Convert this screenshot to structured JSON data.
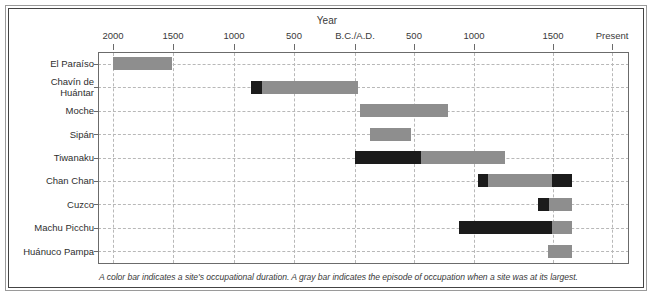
{
  "figure": {
    "title": "Year",
    "footnote": "A color bar indicates a site's occupational duration. A gray bar indicates the episode of occupation when a site was at its largest."
  },
  "chart_data": {
    "type": "bar",
    "orientation": "horizontal",
    "title": "Year",
    "xlabel": "Year",
    "ylabel": "",
    "grid": true,
    "legend_position": "none",
    "axis_ticks": [
      {
        "label": "2000",
        "value": -2000,
        "x": 113
      },
      {
        "label": "1500",
        "value": -1500,
        "x": 173
      },
      {
        "label": "1000",
        "value": -1000,
        "x": 234
      },
      {
        "label": "500",
        "value": -500,
        "x": 294
      },
      {
        "label": "B.C./A.D.",
        "value": 0,
        "x": 355
      },
      {
        "label": "500",
        "value": 500,
        "x": 414
      },
      {
        "label": "1000",
        "value": 1000,
        "x": 474
      },
      {
        "label": "1500",
        "value": 1500,
        "x": 553
      },
      {
        "label": "Present",
        "value": 2000,
        "x": 612
      }
    ],
    "categories": [
      "El Paraíso",
      "Chavín de Huántar",
      "Moche",
      "Sipán",
      "Tiwanaku",
      "Chan Chan",
      "Cuzco",
      "Machu Picchu",
      "Huánuco Pampa"
    ],
    "colors": {
      "occupation": "#8e8e8e",
      "largest": "#1b1b1b",
      "grid": "#b8b8b8",
      "axis": "#6b6b6b",
      "text": "#2e2e2e"
    },
    "series": [
      {
        "name": "El Paraíso",
        "row": 0,
        "segments": [
          {
            "type": "occupation",
            "color": "#8e8e8e",
            "x0": 113,
            "x1": 172,
            "start_year": -2000,
            "end_year": -1510
          }
        ]
      },
      {
        "name": "Chavín de Huántar",
        "row": 1,
        "segments": [
          {
            "type": "largest",
            "color": "#1b1b1b",
            "x0": 251,
            "x1": 262,
            "start_year": -860,
            "end_year": -770
          },
          {
            "type": "occupation",
            "color": "#8e8e8e",
            "x0": 262,
            "x1": 358,
            "start_year": -770,
            "end_year": 25
          }
        ]
      },
      {
        "name": "Moche",
        "row": 2,
        "segments": [
          {
            "type": "occupation",
            "color": "#8e8e8e",
            "x0": 360,
            "x1": 448,
            "start_year": 40,
            "end_year": 770
          }
        ]
      },
      {
        "name": "Sipán",
        "row": 3,
        "segments": [
          {
            "type": "occupation",
            "color": "#8e8e8e",
            "x0": 370,
            "x1": 411,
            "start_year": 125,
            "end_year": 465
          }
        ]
      },
      {
        "name": "Tiwanaku",
        "row": 4,
        "segments": [
          {
            "type": "largest",
            "color": "#1b1b1b",
            "x0": 355,
            "x1": 421,
            "start_year": 0,
            "end_year": 550
          },
          {
            "type": "occupation",
            "color": "#8e8e8e",
            "x0": 421,
            "x1": 505,
            "start_year": 550,
            "end_year": 1250
          }
        ]
      },
      {
        "name": "Chan Chan",
        "row": 5,
        "segments": [
          {
            "type": "largest",
            "color": "#1b1b1b",
            "x0": 478,
            "x1": 488,
            "start_year": 1030,
            "end_year": 1115
          },
          {
            "type": "occupation",
            "color": "#8e8e8e",
            "x0": 488,
            "x1": 552,
            "start_year": 1115,
            "end_year": 1645
          },
          {
            "type": "largest",
            "color": "#1b1b1b",
            "x0": 552,
            "x1": 572,
            "start_year": 1645,
            "end_year": 1810
          }
        ]
      },
      {
        "name": "Cuzco",
        "row": 6,
        "segments": [
          {
            "type": "largest",
            "color": "#1b1b1b",
            "x0": 538,
            "x1": 549,
            "start_year": 1530,
            "end_year": 1620
          },
          {
            "type": "occupation",
            "color": "#8e8e8e",
            "x0": 549,
            "x1": 572,
            "start_year": 1620,
            "end_year": 1810
          }
        ]
      },
      {
        "name": "Machu Picchu",
        "row": 7,
        "segments": [
          {
            "type": "largest",
            "color": "#1b1b1b",
            "x0": 459,
            "x1": 552,
            "start_year": 870,
            "end_year": 1645
          },
          {
            "type": "occupation",
            "color": "#8e8e8e",
            "x0": 552,
            "x1": 572,
            "start_year": 1645,
            "end_year": 1810
          }
        ]
      },
      {
        "name": "Huánuco Pampa",
        "row": 8,
        "segments": [
          {
            "type": "occupation",
            "color": "#8e8e8e",
            "x0": 548,
            "x1": 572,
            "start_year": 1615,
            "end_year": 1810
          }
        ]
      }
    ]
  }
}
